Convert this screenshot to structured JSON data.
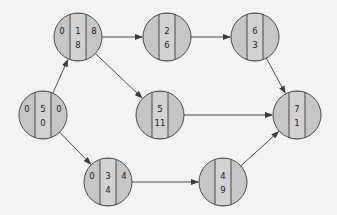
{
  "colors": {
    "background": "#f3f3f3",
    "node_fill": "#c6c6c6",
    "strip_fill": "#d2d2d2",
    "stroke": "#3a3a3a",
    "text": "#222222"
  },
  "nodes": [
    {
      "id": "A",
      "cx": 43,
      "cy": 115,
      "left": "0",
      "top": "5",
      "right": "0",
      "bottom": "0"
    },
    {
      "id": "B",
      "cx": 78,
      "cy": 37,
      "left": "0",
      "top": "1",
      "right": "8",
      "bottom": "8"
    },
    {
      "id": "C",
      "cx": 167,
      "cy": 37,
      "left": "",
      "top": "2",
      "right": "",
      "bottom": "6"
    },
    {
      "id": "D",
      "cx": 255,
      "cy": 37,
      "left": "",
      "top": "6",
      "right": "",
      "bottom": "3"
    },
    {
      "id": "E",
      "cx": 160,
      "cy": 115,
      "left": "",
      "top": "5",
      "right": "",
      "bottom": "11"
    },
    {
      "id": "F",
      "cx": 297,
      "cy": 115,
      "left": "",
      "top": "7",
      "right": "",
      "bottom": "1"
    },
    {
      "id": "G",
      "cx": 108,
      "cy": 182,
      "left": "0",
      "top": "3",
      "right": "4",
      "bottom": "4"
    },
    {
      "id": "H",
      "cx": 223,
      "cy": 182,
      "left": "",
      "top": "4",
      "right": "",
      "bottom": "9"
    }
  ],
  "edges": [
    {
      "from": "A",
      "to": "B"
    },
    {
      "from": "A",
      "to": "G"
    },
    {
      "from": "B",
      "to": "C"
    },
    {
      "from": "B",
      "to": "E"
    },
    {
      "from": "C",
      "to": "D"
    },
    {
      "from": "D",
      "to": "F"
    },
    {
      "from": "E",
      "to": "F"
    },
    {
      "from": "G",
      "to": "H"
    },
    {
      "from": "H",
      "to": "F"
    }
  ],
  "node_radius": 24
}
